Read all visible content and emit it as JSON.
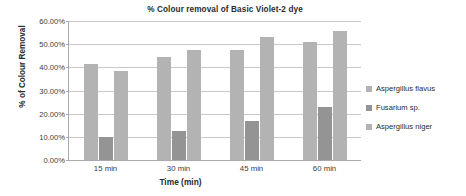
{
  "chart_data": {
    "type": "bar",
    "title": "%  Colour removal of Basic Violet-2 dye",
    "xlabel": "Time (min)",
    "ylabel": "% of Colour Removal",
    "categories": [
      "15 min",
      "30 min",
      "45 min",
      "60 min"
    ],
    "series": [
      {
        "name": "Aspergillus flavus",
        "color": "#b3b3b3",
        "values": [
          41.3,
          44.3,
          47.7,
          50.8
        ]
      },
      {
        "name": "Fusarium sp.",
        "color": "#949494",
        "values": [
          10.0,
          12.6,
          17.0,
          22.9
        ]
      },
      {
        "name": "Aspergillus niger",
        "color": "#b3b3b3",
        "values": [
          38.6,
          47.4,
          53.3,
          55.5
        ]
      }
    ],
    "ylim": [
      0,
      60
    ],
    "ytick_values": [
      0,
      10,
      20,
      30,
      40,
      50,
      60
    ],
    "ytick_labels": [
      "0.00%",
      "10.00%",
      "20.00%",
      "30.00%",
      "40.00%",
      "50.00%",
      "60.00%"
    ],
    "grid": true,
    "legend_position": "right"
  }
}
